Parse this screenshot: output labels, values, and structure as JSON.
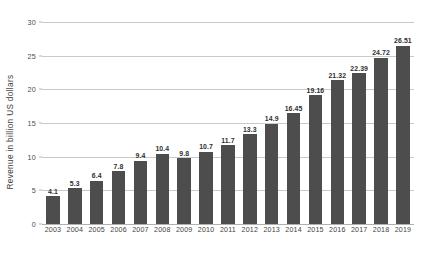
{
  "chart_data": {
    "type": "bar",
    "title": "",
    "subtitle": "",
    "xlabel": "",
    "ylabel": "Revenue in billion US dollars",
    "ylim": [
      0,
      30
    ],
    "ytick_values": [
      0,
      5,
      10,
      15,
      20,
      25,
      30
    ],
    "ytick_labels": [
      "0",
      "5",
      "10",
      "15",
      "20",
      "25",
      "30"
    ],
    "grid": "horizontal",
    "legend": "none",
    "bar_color": "#4d4d4d",
    "gridline_color": "#c9c9c9",
    "background_color": "#ffffff",
    "categories": [
      "2003",
      "2004",
      "2005",
      "2006",
      "2007",
      "2008",
      "2009",
      "2010",
      "2011",
      "2012",
      "2013",
      "2014",
      "2015",
      "2016",
      "2017",
      "2018",
      "2019"
    ],
    "values": [
      4.1,
      5.3,
      6.4,
      7.8,
      9.4,
      10.4,
      9.8,
      10.7,
      11.7,
      13.3,
      14.9,
      16.45,
      19.16,
      21.32,
      22.39,
      24.72,
      26.51
    ],
    "value_labels": [
      "4.1",
      "5.3",
      "6.4",
      "7.8",
      "9.4",
      "10.4",
      "9.8",
      "10.7",
      "11.7",
      "13.3",
      "14.9",
      "16.45",
      "19.16",
      "21.32",
      "22.39",
      "24.72",
      "26.51"
    ]
  }
}
